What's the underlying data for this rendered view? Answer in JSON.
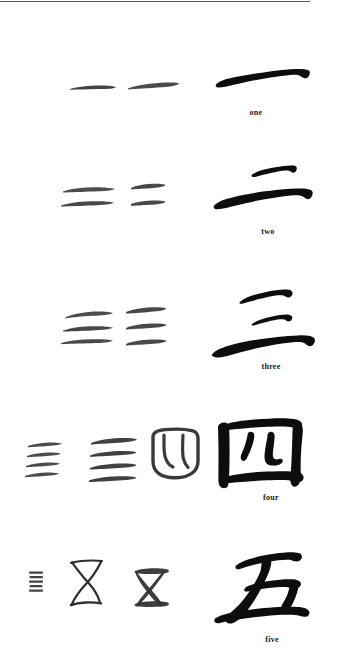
{
  "page": {
    "background_color": "#ffffff",
    "ink_color": "#111111",
    "rule_color": "#5b5b5b",
    "width": 338,
    "height": 661
  },
  "divider": {
    "name": "top-horizontal-rule",
    "visible": true
  },
  "rows": [
    {
      "id": "one",
      "label": "one",
      "numeral": 1,
      "modern_character": "一",
      "variants": [
        {
          "name": "oracle-bone-form",
          "strokes": 1,
          "style": "thin-faint"
        },
        {
          "name": "bronze-script-form",
          "strokes": 1,
          "style": "medium-gray"
        },
        {
          "name": "modern-brush-form",
          "strokes": 1,
          "style": "bold-black"
        }
      ]
    },
    {
      "id": "two",
      "label": "two",
      "numeral": 2,
      "modern_character": "二",
      "variants": [
        {
          "name": "oracle-bone-form",
          "strokes": 2,
          "style": "thin-faint"
        },
        {
          "name": "bronze-script-form",
          "strokes": 2,
          "style": "medium-gray"
        },
        {
          "name": "modern-brush-form",
          "strokes": 2,
          "style": "bold-black"
        }
      ]
    },
    {
      "id": "three",
      "label": "three",
      "numeral": 3,
      "modern_character": "三",
      "variants": [
        {
          "name": "oracle-bone-form",
          "strokes": 3,
          "style": "thin-faint"
        },
        {
          "name": "bronze-script-form",
          "strokes": 3,
          "style": "medium-gray"
        },
        {
          "name": "modern-brush-form",
          "strokes": 3,
          "style": "bold-black"
        }
      ]
    },
    {
      "id": "four",
      "label": "four",
      "numeral": 4,
      "modern_character": "四",
      "variants": [
        {
          "name": "oracle-bone-form",
          "strokes": 4,
          "style": "thin-faint"
        },
        {
          "name": "bronze-script-form",
          "strokes": 4,
          "style": "medium-gray"
        },
        {
          "name": "seal-script-form",
          "strokes": 0,
          "style": "outlined-box"
        },
        {
          "name": "modern-brush-form",
          "strokes": 0,
          "style": "bold-black"
        }
      ]
    },
    {
      "id": "five",
      "label": "five",
      "numeral": 5,
      "modern_character": "五",
      "variants": [
        {
          "name": "tally-mark-form",
          "strokes": 5,
          "style": "tiny-faint"
        },
        {
          "name": "oracle-bone-form",
          "strokes": 0,
          "style": "thin-hourglass"
        },
        {
          "name": "bronze-script-form",
          "strokes": 0,
          "style": "medium-hourglass"
        },
        {
          "name": "modern-brush-form",
          "strokes": 0,
          "style": "bold-black"
        }
      ]
    }
  ]
}
